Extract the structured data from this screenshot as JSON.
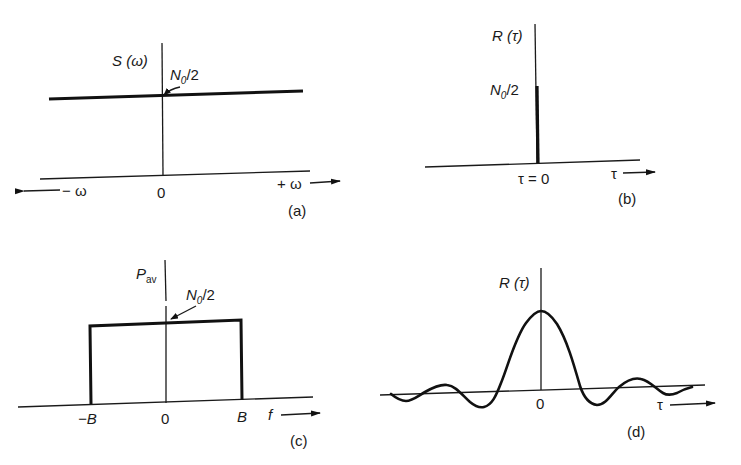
{
  "figure": {
    "panels": [
      {
        "id": "a",
        "caption": "(a)",
        "y_label": "S (ω)",
        "level_label_main": "N",
        "level_label_sub": "0",
        "level_label_rest": "/2",
        "x_neg_label": "− ω",
        "x_pos_label": "+ ω",
        "origin_label": "0",
        "description": "Flat power spectral density of white noise, constant at N0/2 for all ω"
      },
      {
        "id": "b",
        "caption": "(b)",
        "y_label": "R (τ)",
        "level_label_main": "N",
        "level_label_sub": "0",
        "level_label_rest": "/2",
        "origin_label": "τ = 0",
        "x_label": "τ",
        "description": "Autocorrelation of white noise: impulse at τ = 0"
      },
      {
        "id": "c",
        "caption": "(c)",
        "y_label_main": "P",
        "y_label_sub": "av",
        "level_label_main": "N",
        "level_label_sub": "0",
        "level_label_rest": "/2",
        "x_neg_label": "−B",
        "x_pos_label": "B",
        "origin_label": "0",
        "x_label": "f",
        "description": "Band-limited noise spectrum, flat at N0/2 between −B and B"
      },
      {
        "id": "d",
        "caption": "(d)",
        "y_label": "R (τ)",
        "origin_label": "0",
        "x_label": "τ",
        "description": "Autocorrelation of band-limited noise: sinc-shaped curve with main lobe at τ = 0"
      }
    ]
  },
  "colors": {
    "ink": "#111111",
    "background": "#ffffff"
  }
}
